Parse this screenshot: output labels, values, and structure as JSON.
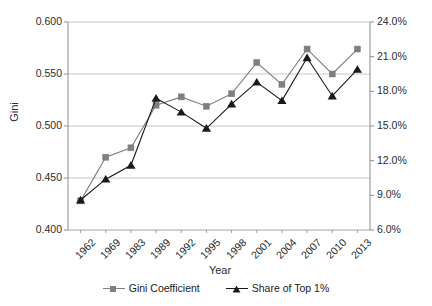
{
  "chart_data": {
    "type": "line",
    "title": "",
    "xlabel": "Year",
    "ylabel": "Gini",
    "y2label": "",
    "categories": [
      "1962",
      "1969",
      "1983",
      "1989",
      "1992",
      "1995",
      "1998",
      "2001",
      "2004",
      "2007",
      "2010",
      "2013"
    ],
    "ylim": [
      0.4,
      0.6
    ],
    "y2lim": [
      6.0,
      24.0
    ],
    "yticks": [
      "0.400",
      "0.450",
      "0.500",
      "0.550",
      "0.600"
    ],
    "ytick_values": [
      0.4,
      0.45,
      0.5,
      0.55,
      0.6
    ],
    "y2ticks": [
      "6.0%",
      "9.0%",
      "12.0%",
      "15.0%",
      "18.0%",
      "21.0%",
      "24.0%"
    ],
    "y2tick_values": [
      6.0,
      9.0,
      12.0,
      15.0,
      18.0,
      21.0,
      24.0
    ],
    "grid": true,
    "legend_position": "bottom",
    "series": [
      {
        "name": "Gini Coefficient",
        "axis": "left",
        "marker": "square",
        "color": "#7f7f7f",
        "values": [
          0.428,
          0.47,
          0.479,
          0.52,
          0.528,
          0.519,
          0.531,
          0.561,
          0.54,
          0.574,
          0.55,
          0.574
        ]
      },
      {
        "name": "Share of Top 1%",
        "axis": "right",
        "marker": "triangle",
        "color": "#1a1a1a",
        "values": [
          8.6,
          10.4,
          11.6,
          17.4,
          16.2,
          14.8,
          16.9,
          18.8,
          17.2,
          20.9,
          17.6,
          19.9
        ]
      }
    ]
  },
  "legend": {
    "items": [
      {
        "label": "Gini Coefficient"
      },
      {
        "label": "Share of Top 1%"
      }
    ]
  },
  "colors": {
    "gini": "#7f7f7f",
    "share": "#1a1a1a",
    "grid": "#b8b8b8",
    "axis": "#8c8c8c",
    "text": "#2b2b2b"
  }
}
